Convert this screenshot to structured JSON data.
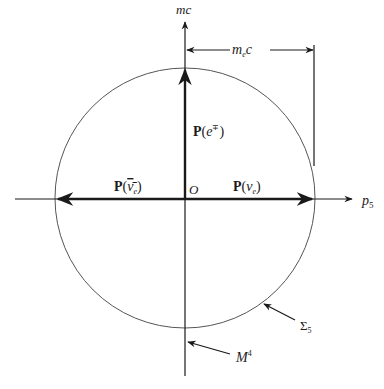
{
  "diagram": {
    "axes": {
      "vertical_label": "mc",
      "horizontal_label_base": "p",
      "horizontal_label_sub": "5",
      "origin_label": "O"
    },
    "dimension": {
      "label_base": "m",
      "label_sub": "e",
      "label_tail": "c"
    },
    "vectors": {
      "electron": {
        "prefix": "P(",
        "var": "e",
        "sup": "∓",
        "suffix": ")"
      },
      "neutrino": {
        "prefix": "P(",
        "var": "ν",
        "sub": "e",
        "suffix": ")"
      },
      "antineutrino": {
        "prefix": "P(",
        "var": "ν̄",
        "sub": "e",
        "suffix": ")"
      }
    },
    "annotations": {
      "sphere_base": "Σ",
      "sphere_sub": "5",
      "spacetime_base": "M",
      "spacetime_sup": "4"
    },
    "colors": {
      "line": "#1a1a1a",
      "circle": "#555555"
    }
  }
}
